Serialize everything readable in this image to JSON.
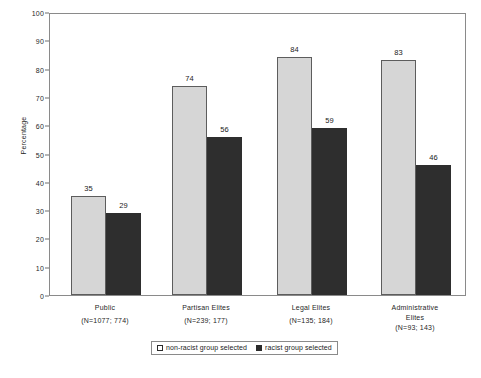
{
  "chart_data": {
    "type": "bar",
    "title": "",
    "xlabel": "",
    "ylabel": "Percentage",
    "ylim": [
      0,
      100
    ],
    "ytick_values": [
      100,
      90,
      80,
      70,
      60,
      50,
      40,
      30,
      20,
      10,
      0
    ],
    "grid": false,
    "legend_position": "bottom",
    "categories": [
      "Public",
      "Partisan Elites",
      "Legal Elites",
      "Administrative\nElites"
    ],
    "category_sample_sizes": [
      "(N=1077; 774)",
      "(N=239; 177)",
      "(N=135; 184)",
      "(N=93; 143)"
    ],
    "series": [
      {
        "name": "non-racist group selected",
        "color": "#d6d6d6",
        "values": [
          35,
          74,
          84,
          83
        ]
      },
      {
        "name": "racist group selected",
        "color": "#2e2e2e",
        "values": [
          29,
          56,
          59,
          46
        ]
      }
    ]
  },
  "legend": {
    "items": [
      {
        "label": "non-racist group selected",
        "swatch": "light"
      },
      {
        "label": "racist group selected",
        "swatch": "dark"
      }
    ]
  }
}
